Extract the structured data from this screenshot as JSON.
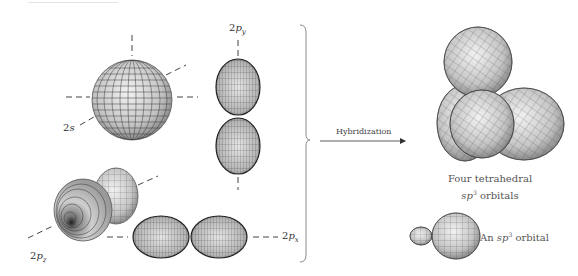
{
  "figure": {
    "left_panel": {
      "orbitals": [
        {
          "name": "2s",
          "prefix": "2",
          "letter": "s",
          "sub": ""
        },
        {
          "name": "2py",
          "prefix": "2",
          "letter": "p",
          "sub": "y"
        },
        {
          "name": "2pz",
          "prefix": "2",
          "letter": "p",
          "sub": "z"
        },
        {
          "name": "2px",
          "prefix": "2",
          "letter": "p",
          "sub": "x"
        }
      ]
    },
    "arrow": {
      "label": "Hybridization"
    },
    "right_panel": {
      "tetrahedral_caption_line1": "Four tetrahedral",
      "tetrahedral_caption_line2_italic": "sp",
      "tetrahedral_caption_line2_sup": "3",
      "tetrahedral_caption_line2_rest": " orbitals",
      "single_caption_prefix": "An ",
      "single_caption_italic": "sp",
      "single_caption_sup": "3",
      "single_caption_rest": " orbital"
    },
    "colors": {
      "orbital_fill": "#c8c8c8",
      "orbital_dark": "#555555",
      "mesh": "#3a3a3a",
      "axis": "#444444",
      "bracket": "#888888"
    }
  }
}
